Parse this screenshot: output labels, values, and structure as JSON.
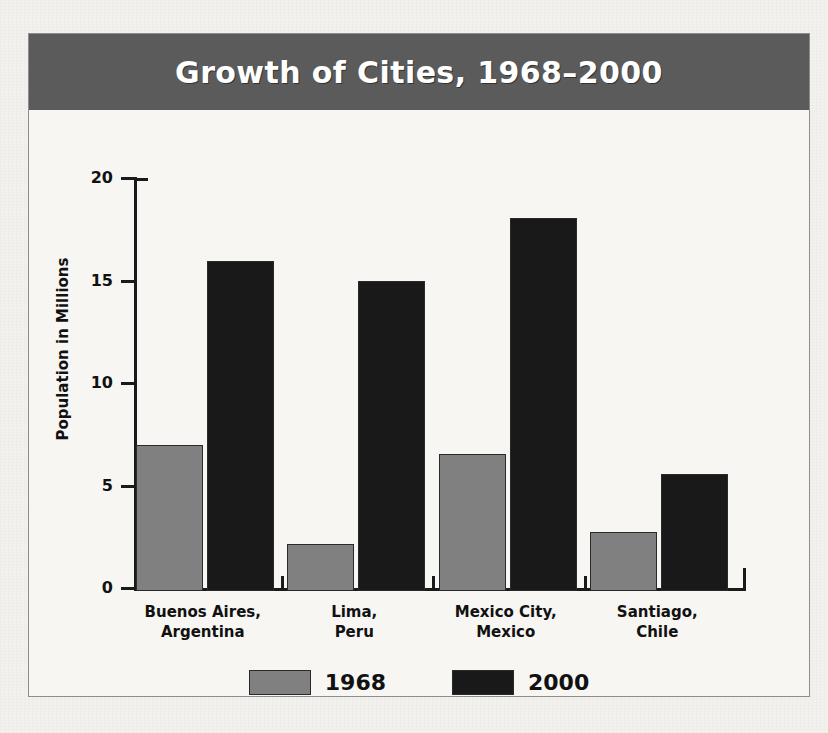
{
  "chart_data": {
    "type": "bar",
    "title": "Growth of Cities, 1968–2000",
    "xlabel": "",
    "ylabel": "Population in Millions",
    "ylim": [
      0,
      20
    ],
    "yticks": [
      0,
      5,
      10,
      15,
      20
    ],
    "ytick_labels": [
      "0",
      "5",
      "10",
      "15",
      "20"
    ],
    "grid": false,
    "legend_position": "bottom-center",
    "categories": [
      "Buenos Aires,\nArgentina",
      "Lima,\nPeru",
      "Mexico City,\nMexico",
      "Santiago,\nChile"
    ],
    "category_lines": [
      [
        "Buenos Aires,",
        "Argentina"
      ],
      [
        "Lima,",
        "Peru"
      ],
      [
        "Mexico City,",
        "Mexico"
      ],
      [
        "Santiago,",
        "Chile"
      ]
    ],
    "series": [
      {
        "name": "1968",
        "color": "#808080",
        "values": [
          7.1,
          2.3,
          6.7,
          2.9
        ]
      },
      {
        "name": "2000",
        "color": "#191919",
        "values": [
          16.1,
          15.1,
          18.2,
          5.7
        ]
      }
    ]
  },
  "legend": {
    "items": [
      {
        "label": "1968",
        "swatch": "#808080"
      },
      {
        "label": "2000",
        "swatch": "#191919"
      }
    ]
  },
  "colors": {
    "title_band": "#5b5b5b",
    "title_text": "#ffffff",
    "page_background": "#f2f1ee",
    "plot_background": "#f7f6f3",
    "axis": "#1a1a1a",
    "frame_border": "#8d8d8d"
  }
}
